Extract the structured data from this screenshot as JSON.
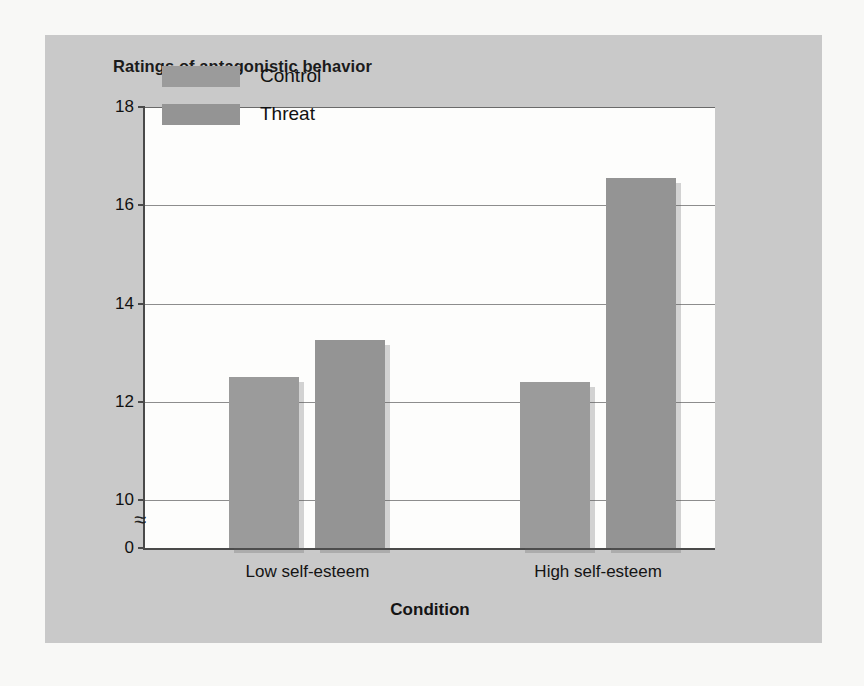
{
  "figure": {
    "title": "Ratings of antagonistic behavior",
    "panel_bg": "#c9c9c9",
    "page_bg": "#f8f8f6",
    "plot_bg": "#fdfdfc"
  },
  "chart_data": {
    "type": "bar",
    "title": "Ratings of antagonistic behavior",
    "xlabel": "Condition",
    "ylabel": "",
    "categories": [
      "Low self-esteem",
      "High self-esteem"
    ],
    "series": [
      {
        "name": "Control",
        "values": [
          12.5,
          12.4
        ],
        "color": "#9b9b9b"
      },
      {
        "name": "Threat",
        "values": [
          13.25,
          16.55
        ],
        "color": "#949494"
      }
    ],
    "ylim": [
      0,
      18
    ],
    "yticks": [
      18,
      16,
      14,
      12,
      10,
      0
    ],
    "ytick_labels": [
      "18",
      "16",
      "14",
      "12",
      "10",
      "0"
    ],
    "axis_break": {
      "present": true,
      "symbol": "≈",
      "between": [
        10,
        0
      ]
    },
    "grid": true,
    "gridlines_at": [
      16,
      14,
      12,
      10
    ],
    "legend_position": "top-left-inside",
    "legend": [
      "Control",
      "Threat"
    ]
  },
  "yaxis": {
    "ticks": [
      {
        "label": "18",
        "value": 18
      },
      {
        "label": "16",
        "value": 16
      },
      {
        "label": "14",
        "value": 14
      },
      {
        "label": "12",
        "value": 12
      },
      {
        "label": "10",
        "value": 10
      },
      {
        "label": "0",
        "value": 0
      }
    ],
    "break_symbol": "≈"
  },
  "xaxis": {
    "title": "Condition",
    "groups": [
      "Low self-esteem",
      "High self-esteem"
    ]
  },
  "legend": {
    "items": [
      {
        "label": "Control",
        "color": "#9b9b9b"
      },
      {
        "label": "Threat",
        "color": "#949494"
      }
    ]
  }
}
